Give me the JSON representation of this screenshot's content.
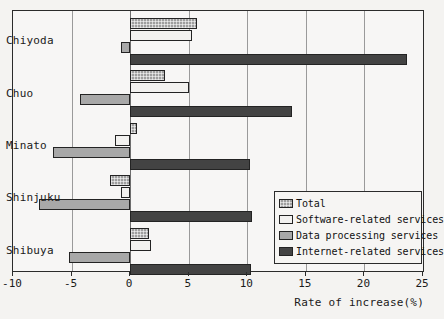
{
  "chart_data": {
    "type": "bar",
    "orientation": "horizontal",
    "title": "",
    "xlabel": "Rate of increase(%)",
    "ylabel": "",
    "xlim": [
      -10,
      25
    ],
    "xticks": [
      -10,
      -5,
      0,
      5,
      10,
      15,
      20,
      25
    ],
    "xtick_labels": [
      "-10",
      "-5",
      "0",
      "5",
      "10",
      "15",
      "20",
      "25"
    ],
    "grid": true,
    "legend_position": "inner-lower-right",
    "categories": [
      "Chiyoda",
      "Chuo",
      "Minato",
      "Shinjuku",
      "Shibuya"
    ],
    "series": [
      {
        "name": "Total",
        "color": "#9e9e9e",
        "pattern": "checkered",
        "values": [
          5.7,
          3.0,
          0.6,
          -1.7,
          1.6
        ]
      },
      {
        "name": "Software-related services",
        "color": "#f2f1ef",
        "pattern": "solid-white",
        "values": [
          5.3,
          5.0,
          -1.3,
          -0.8,
          1.8
        ]
      },
      {
        "name": "Data processing services",
        "color": "#a8a8a8",
        "pattern": "solid-gray",
        "values": [
          -0.8,
          -4.3,
          -6.6,
          -7.8,
          -5.2
        ]
      },
      {
        "name": "Internet-related services",
        "color": "#434343",
        "pattern": "solid-darkgray",
        "values": [
          23.6,
          13.8,
          10.2,
          10.4,
          10.3
        ]
      }
    ]
  },
  "legend": {
    "items": [
      {
        "label": "Total"
      },
      {
        "label": "Software-related services"
      },
      {
        "label": "Data processing services"
      },
      {
        "label": "Internet-related services"
      }
    ]
  },
  "axis": {
    "x_title": "Rate of increase(%)"
  }
}
